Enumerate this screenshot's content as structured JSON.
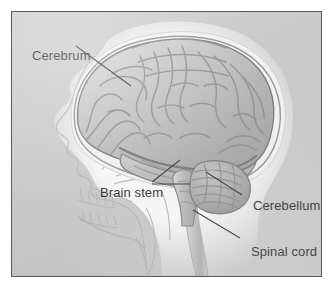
{
  "figure": {
    "kind": "anatomical-illustration",
    "background_color": "#c9c9c9",
    "frame_border_color": "#5a5a5a",
    "label_text_color": "#1b1b1b",
    "leader_line_color": "#2b2b2b",
    "skull_outline_color": "#b9b9b9",
    "brain_fill_color": "#bdbdbd",
    "brain_sulci_color": "#8a8a8a",
    "cerebellum_color": "#a8a8a8",
    "spinal_cord_color": "#c2c2c2"
  },
  "labels": {
    "cerebrum": "Cerebrum",
    "brain_stem": "Brain stem",
    "cerebellum": "Cerebellum",
    "spinal_cord": "Spinal cord"
  }
}
